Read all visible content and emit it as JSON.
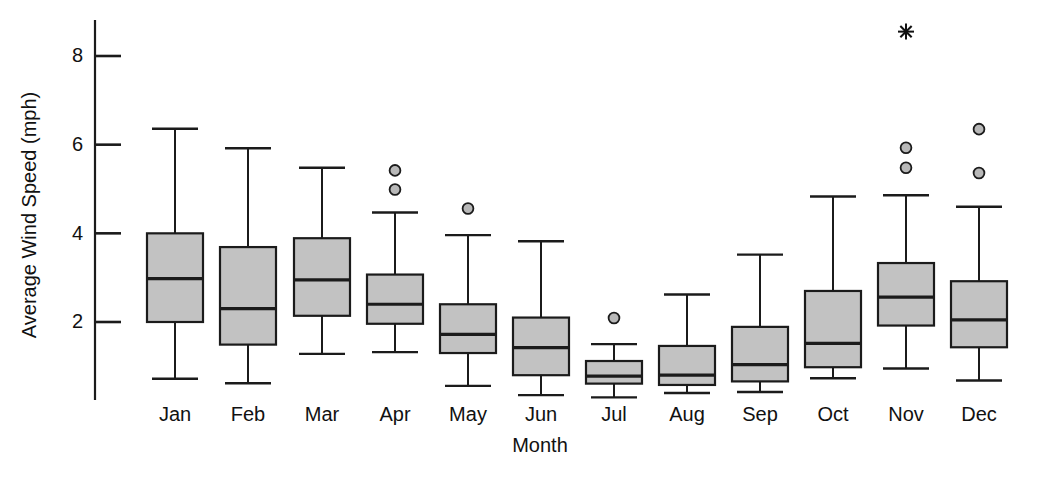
{
  "chart_data": {
    "type": "box",
    "title": "",
    "xlabel": "Month",
    "ylabel": "Average Wind Speed (mph)",
    "categories": [
      "Jan",
      "Feb",
      "Mar",
      "Apr",
      "May",
      "Jun",
      "Jul",
      "Aug",
      "Sep",
      "Oct",
      "Nov",
      "Dec"
    ],
    "ytick_labels": [
      "8",
      "6",
      "4",
      "2"
    ],
    "ytick_values": [
      8,
      6,
      4,
      2
    ],
    "ylim": [
      0.25,
      8.85
    ],
    "grid": false,
    "legend": null,
    "box_fill_color": "#c2c2c2",
    "line_color": "#1b1b1b",
    "boxes": [
      {
        "category": "Jan",
        "whisker_low": 0.72,
        "q1": 2.0,
        "median": 2.98,
        "q3": 4.0,
        "whisker_high": 6.36,
        "outliers": [],
        "extremes": []
      },
      {
        "category": "Feb",
        "whisker_low": 0.62,
        "q1": 1.49,
        "median": 2.3,
        "q3": 3.69,
        "whisker_high": 5.92,
        "outliers": [],
        "extremes": []
      },
      {
        "category": "Mar",
        "whisker_low": 1.28,
        "q1": 2.14,
        "median": 2.95,
        "q3": 3.89,
        "whisker_high": 5.48,
        "outliers": [],
        "extremes": []
      },
      {
        "category": "Apr",
        "whisker_low": 1.32,
        "q1": 1.96,
        "median": 2.4,
        "q3": 3.07,
        "whisker_high": 4.47,
        "outliers": [
          5.42,
          4.99
        ],
        "extremes": []
      },
      {
        "category": "May",
        "whisker_low": 0.56,
        "q1": 1.3,
        "median": 1.72,
        "q3": 2.4,
        "whisker_high": 3.96,
        "outliers": [
          4.56
        ],
        "extremes": []
      },
      {
        "category": "Jun",
        "whisker_low": 0.35,
        "q1": 0.8,
        "median": 1.42,
        "q3": 2.1,
        "whisker_high": 3.82,
        "outliers": [],
        "extremes": []
      },
      {
        "category": "Jul",
        "whisker_low": 0.3,
        "q1": 0.61,
        "median": 0.78,
        "q3": 1.12,
        "whisker_high": 1.5,
        "outliers": [
          2.09
        ],
        "extremes": []
      },
      {
        "category": "Aug",
        "whisker_low": 0.4,
        "q1": 0.58,
        "median": 0.8,
        "q3": 1.46,
        "whisker_high": 2.62,
        "outliers": [],
        "extremes": []
      },
      {
        "category": "Sep",
        "whisker_low": 0.42,
        "q1": 0.66,
        "median": 1.04,
        "q3": 1.89,
        "whisker_high": 3.52,
        "outliers": [],
        "extremes": []
      },
      {
        "category": "Oct",
        "whisker_low": 0.73,
        "q1": 0.98,
        "median": 1.52,
        "q3": 2.7,
        "whisker_high": 4.83,
        "outliers": [],
        "extremes": []
      },
      {
        "category": "Nov",
        "whisker_low": 0.95,
        "q1": 1.92,
        "median": 2.56,
        "q3": 3.33,
        "whisker_high": 4.86,
        "outliers": [
          5.93,
          5.48
        ],
        "extremes": [
          8.55
        ]
      },
      {
        "category": "Dec",
        "whisker_low": 0.68,
        "q1": 1.43,
        "median": 2.05,
        "q3": 2.92,
        "whisker_high": 4.6,
        "outliers": [
          6.35,
          5.36
        ],
        "extremes": []
      }
    ]
  },
  "axes": {
    "y_axis_name": "y-axis",
    "x_axis_name": "x-axis"
  }
}
